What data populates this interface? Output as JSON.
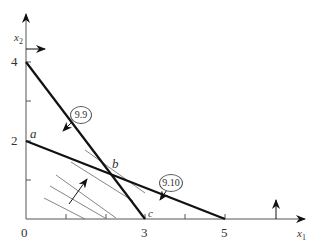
{
  "axes": {
    "x_label": "x",
    "x_sub": "1",
    "y_label": "x",
    "y_sub": "2",
    "origin": "0",
    "x_ticks": [
      "3",
      "5"
    ],
    "y_ticks": [
      "4",
      "2"
    ]
  },
  "constraints": [
    {
      "id": "9.9",
      "from": [
        0,
        4
      ],
      "to": [
        3,
        0
      ]
    },
    {
      "id": "9.10",
      "from": [
        0,
        2
      ],
      "to": [
        5,
        0
      ]
    }
  ],
  "points": {
    "a": "a",
    "b": "b",
    "c": "c"
  },
  "colors": {
    "line": "#111111",
    "axis": "#555555",
    "hatch": "#666666"
  }
}
